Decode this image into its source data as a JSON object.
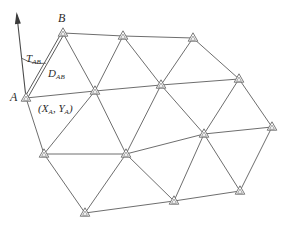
{
  "diagram": {
    "type": "survey-triangulation-network",
    "canvas": {
      "width": 286,
      "height": 228,
      "background": "#ffffff"
    },
    "colors": {
      "edge": "#6e6e6e",
      "station_stroke": "#6b6b6b",
      "station_fill": "#ffffff",
      "north_arrow": "#3a3a3a",
      "label_text": "#2b2b2b"
    },
    "labels": {
      "point_a": "A",
      "point_b": "B",
      "azimuth": "T",
      "azimuth_sub": "AB",
      "distance": "D",
      "distance_sub": "AB",
      "coord_open": "(X",
      "coord_sub_x": "A",
      "coord_mid": ", Y",
      "coord_sub_y": "A",
      "coord_close": ")"
    },
    "stations": [
      {
        "id": "B",
        "name": "station-b",
        "x": 63,
        "y": 33,
        "label": "B"
      },
      {
        "id": "n2",
        "name": "station-top-2",
        "x": 123,
        "y": 36,
        "label": ""
      },
      {
        "id": "n3",
        "name": "station-top-3",
        "x": 193,
        "y": 38,
        "label": ""
      },
      {
        "id": "A",
        "name": "station-a",
        "x": 26,
        "y": 98,
        "label": "A"
      },
      {
        "id": "n5",
        "name": "station-mid-2",
        "x": 95,
        "y": 91,
        "label": ""
      },
      {
        "id": "n6",
        "name": "station-mid-3",
        "x": 161,
        "y": 85,
        "label": ""
      },
      {
        "id": "n7",
        "name": "station-mid-4",
        "x": 239,
        "y": 79,
        "label": ""
      },
      {
        "id": "n8",
        "name": "station-low-1",
        "x": 44,
        "y": 154,
        "label": ""
      },
      {
        "id": "n9",
        "name": "station-low-2",
        "x": 126,
        "y": 154,
        "label": ""
      },
      {
        "id": "n10",
        "name": "station-low-3",
        "x": 204,
        "y": 134,
        "label": ""
      },
      {
        "id": "n11",
        "name": "station-low-4",
        "x": 272,
        "y": 127,
        "label": ""
      },
      {
        "id": "n12",
        "name": "station-bottom-1",
        "x": 85,
        "y": 213,
        "label": ""
      },
      {
        "id": "n13",
        "name": "station-bottom-2",
        "x": 174,
        "y": 201,
        "label": ""
      },
      {
        "id": "n14",
        "name": "station-bottom-3",
        "x": 240,
        "y": 191,
        "label": ""
      }
    ],
    "edges": [
      {
        "from": "B",
        "to": "n2"
      },
      {
        "from": "n2",
        "to": "n3"
      },
      {
        "from": "B",
        "to": "n5"
      },
      {
        "from": "n2",
        "to": "n5"
      },
      {
        "from": "n2",
        "to": "n6"
      },
      {
        "from": "n3",
        "to": "n6"
      },
      {
        "from": "n3",
        "to": "n7"
      },
      {
        "from": "A",
        "to": "n5"
      },
      {
        "from": "n5",
        "to": "n6"
      },
      {
        "from": "n6",
        "to": "n7"
      },
      {
        "from": "A",
        "to": "n8"
      },
      {
        "from": "n5",
        "to": "n8"
      },
      {
        "from": "n5",
        "to": "n9"
      },
      {
        "from": "n6",
        "to": "n9"
      },
      {
        "from": "n6",
        "to": "n10"
      },
      {
        "from": "n7",
        "to": "n10"
      },
      {
        "from": "n7",
        "to": "n11"
      },
      {
        "from": "n8",
        "to": "n9"
      },
      {
        "from": "n9",
        "to": "n10"
      },
      {
        "from": "n10",
        "to": "n11"
      },
      {
        "from": "n8",
        "to": "n12"
      },
      {
        "from": "n9",
        "to": "n12"
      },
      {
        "from": "n9",
        "to": "n13"
      },
      {
        "from": "n10",
        "to": "n13"
      },
      {
        "from": "n10",
        "to": "n14"
      },
      {
        "from": "n11",
        "to": "n14"
      },
      {
        "from": "n12",
        "to": "n13"
      },
      {
        "from": "n13",
        "to": "n14"
      }
    ],
    "north_arrow": {
      "name": "north-arrow",
      "from": {
        "x": 26,
        "y": 98
      },
      "to": {
        "x": 17,
        "y": 16
      }
    },
    "azimuth_arc": {
      "name": "azimuth-angle-arc",
      "vertex": {
        "x": 26,
        "y": 98
      },
      "radius": 40
    },
    "distance_line": {
      "name": "distance-measure-ab",
      "from": {
        "x": 26,
        "y": 98
      },
      "to": {
        "x": 63,
        "y": 33
      },
      "style": "double-line"
    },
    "label_positions": {
      "point_a": {
        "x": 10,
        "y": 91
      },
      "point_b": {
        "x": 58,
        "y": 12
      },
      "azimuth": {
        "x": 26,
        "y": 53
      },
      "distance": {
        "x": 48,
        "y": 68
      },
      "coord": {
        "x": 38,
        "y": 103
      }
    }
  }
}
